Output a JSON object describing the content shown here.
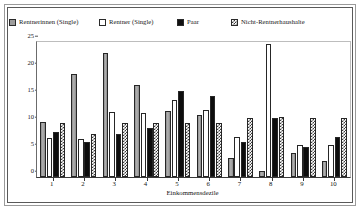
{
  "legend": {
    "position": "top",
    "items": [
      {
        "label": "Rentnerinnen (Single)",
        "swatch": "gray-square-icon",
        "color": "#9d9d9d"
      },
      {
        "label": "Rentner (Single)",
        "swatch": "white-square-icon",
        "color": "#ffffff"
      },
      {
        "label": "Paar",
        "swatch": "black-square-icon",
        "color": "#111111"
      },
      {
        "label": "Nicht-Rentnerhaushalte",
        "swatch": "checkered-square-icon",
        "color": "#3a3a3a"
      }
    ]
  },
  "axes": {
    "y_ticks": [
      "25",
      "20",
      "15",
      "10",
      "5",
      "0"
    ],
    "x_title": "Einkommensdezile",
    "x_labels": [
      "1",
      "2",
      "3",
      "4",
      "5",
      "6",
      "7",
      "8",
      "9",
      "10"
    ]
  },
  "chart_data": {
    "type": "bar",
    "title": "",
    "subtitle": "",
    "xlabel": "Einkommensdezile",
    "ylabel": "",
    "ylim": [
      0,
      25
    ],
    "yticks": [
      0,
      5,
      10,
      15,
      20,
      25
    ],
    "grid": false,
    "legend_position": "top",
    "categories": [
      "1",
      "2",
      "3",
      "4",
      "5",
      "6",
      "7",
      "8",
      "9",
      "10"
    ],
    "series": [
      {
        "name": "Rentnerinnen (Single)",
        "color": "#9d9d9d",
        "pattern": "solid-gray",
        "values": [
          10.2,
          19.0,
          23.0,
          17.0,
          12.2,
          11.5,
          3.5,
          1.2,
          4.5,
          3.0
        ]
      },
      {
        "name": "Rentner (Single)",
        "color": "#ffffff",
        "pattern": "solid-white",
        "values": [
          7.2,
          7.0,
          12.0,
          11.8,
          14.2,
          12.5,
          7.5,
          24.6,
          6.0,
          6.0
        ]
      },
      {
        "name": "Paar",
        "color": "#111111",
        "pattern": "solid-black",
        "values": [
          8.3,
          6.5,
          8.0,
          9.0,
          16.0,
          15.0,
          6.5,
          11.0,
          5.5,
          7.5
        ]
      },
      {
        "name": "Nicht-Rentnerhaushalte",
        "color": "#3a3a3a",
        "pattern": "checkered",
        "values": [
          10.0,
          8.0,
          10.0,
          10.0,
          10.0,
          10.0,
          11.0,
          11.2,
          11.0,
          11.0
        ]
      }
    ]
  }
}
